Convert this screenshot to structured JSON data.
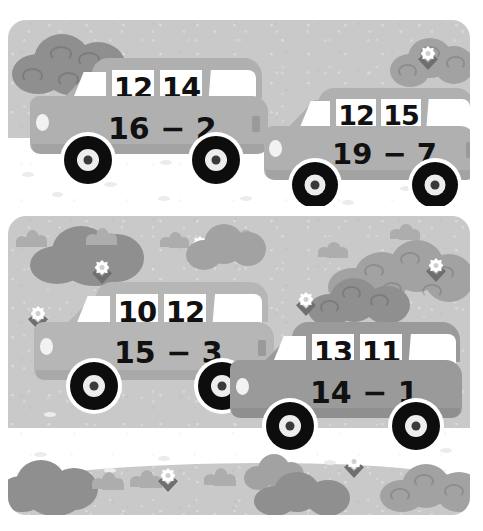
{
  "worksheet": {
    "title": "Subtraction cars picture",
    "type": "math-illustration",
    "scene_count": 2,
    "car_count": 4
  },
  "palette": {
    "sky": "#c9c9c9",
    "ground": "#ffffff",
    "car_light": "#b6b6b6",
    "car_mid": "#b0b0b0",
    "car_dark": "#9a9a9a",
    "window": "#ffffff",
    "tire": "#0d0d0d",
    "hub": "#ededed",
    "text": "#111111",
    "bush_dark": "#8f8f8f",
    "bush_mid": "#a2a2a2",
    "bush_light": "#b4b4b4",
    "flower": "#ffffff"
  },
  "scenes": [
    {
      "name": "top-scene",
      "cars": [
        {
          "id": "car-1",
          "position": "left",
          "window_numbers": [
            "12",
            "14"
          ],
          "expression": "16 − 2",
          "minuend": 16,
          "subtrahend": 2,
          "difference": 14,
          "color": "#b0b0b0"
        },
        {
          "id": "car-2",
          "position": "right",
          "window_numbers": [
            "12",
            "15"
          ],
          "expression": "19 − 7",
          "minuend": 19,
          "subtrahend": 7,
          "difference": 12,
          "color": "#b0b0b0"
        }
      ]
    },
    {
      "name": "bottom-scene",
      "cars": [
        {
          "id": "car-3",
          "position": "left",
          "window_numbers": [
            "10",
            "12"
          ],
          "expression": "15 − 3",
          "minuend": 15,
          "subtrahend": 3,
          "difference": 12,
          "color": "#b6b6b6"
        },
        {
          "id": "car-4",
          "position": "right",
          "window_numbers": [
            "13",
            "11"
          ],
          "expression": "14 − 1",
          "minuend": 14,
          "subtrahend": 1,
          "difference": 13,
          "color": "#9a9a9a"
        }
      ]
    }
  ]
}
